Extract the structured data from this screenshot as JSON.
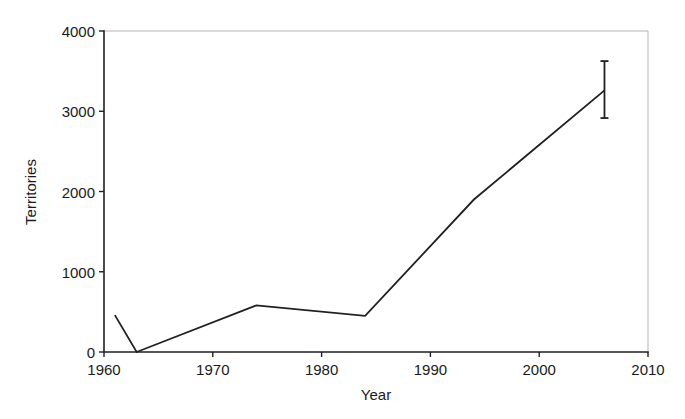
{
  "chart_data": {
    "type": "line",
    "title": "",
    "xlabel": "Year",
    "ylabel": "Territories",
    "xlim": [
      1960,
      2010
    ],
    "ylim": [
      0,
      4000
    ],
    "grid": false,
    "legend": null,
    "xticks": [
      1960,
      1970,
      1980,
      1990,
      2000,
      2010
    ],
    "xtick_labels": [
      "1960",
      "1970",
      "1980",
      "1990",
      "2000",
      "2010"
    ],
    "yticks": [
      0,
      1000,
      2000,
      3000,
      4000
    ],
    "ytick_labels": [
      "0",
      "1000",
      "2000",
      "3000",
      "4000"
    ],
    "series": [
      {
        "name": "Territories",
        "color": "#231f20",
        "x": [
          1961,
          1963,
          1974,
          1984,
          1994,
          2006
        ],
        "values": [
          460,
          0,
          580,
          450,
          1900,
          3260
        ]
      }
    ],
    "error_bars": [
      {
        "x": 2006,
        "y": 3260,
        "lower": 2915,
        "upper": 3625
      }
    ],
    "axis_color": "#231f20",
    "frame_color": "#b3b3b3"
  },
  "figure": {
    "width": 685,
    "height": 419,
    "background": "#ffffff"
  }
}
